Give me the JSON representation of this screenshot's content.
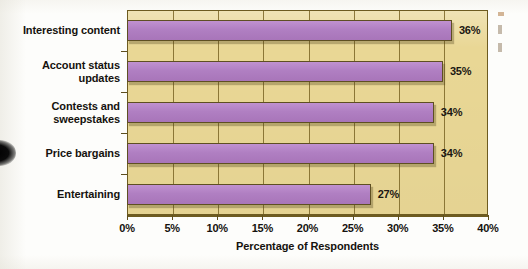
{
  "chart_data": {
    "type": "bar",
    "orientation": "horizontal",
    "title": "",
    "xlabel": "Percentage of Respondents",
    "ylabel": "",
    "xlim": [
      0,
      40
    ],
    "xticks": [
      "0%",
      "5%",
      "10%",
      "15%",
      "20%",
      "25%",
      "30%",
      "35%",
      "40%"
    ],
    "xtick_values": [
      0,
      5,
      10,
      15,
      20,
      25,
      30,
      35,
      40
    ],
    "grid": true,
    "legend": "none",
    "categories": [
      "Interesting content",
      "Account status updates",
      "Contests and sweepstakes",
      "Price bargains",
      "Entertaining"
    ],
    "values": [
      36,
      35,
      34,
      34,
      27
    ],
    "data_labels": [
      "36%",
      "35%",
      "34%",
      "34%",
      "27%"
    ],
    "colors": {
      "bar": "#b07fc2",
      "bar_outline": "#5e4f22",
      "plot_background": "#e9d795",
      "gridline": "#7a6526",
      "text": "#15120e"
    }
  },
  "axis": {
    "x_title": "Percentage of Respondents"
  },
  "categories": [
    {
      "line1": "Interesting content",
      "line2": ""
    },
    {
      "line1": "Account status",
      "line2": "updates"
    },
    {
      "line1": "Contests and",
      "line2": "sweepstakes"
    },
    {
      "line1": "Price bargains",
      "line2": ""
    },
    {
      "line1": "Entertaining",
      "line2": ""
    }
  ]
}
